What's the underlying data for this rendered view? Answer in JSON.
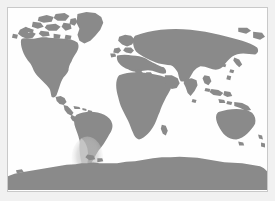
{
  "figure": {
    "type": "world-map",
    "projection": "equirectangular",
    "title": "",
    "caption": "",
    "width": 275,
    "height": 201
  },
  "colors": {
    "land": "#8a8a8a",
    "land_faded": "#c4c4c4",
    "ocean": "#fefefe",
    "frame_border": "#c9c9c9",
    "outer_margin": "#f1f1f1"
  },
  "map": {
    "frame": {
      "x": 7,
      "y": 7,
      "width": 261,
      "height": 185
    },
    "graticule": {
      "visible": false
    },
    "labels": [],
    "legend": {
      "visible": false
    },
    "scalebar": {
      "visible": false
    },
    "north_arrow": {
      "visible": false
    }
  },
  "regions": [
    {
      "name": "north-america",
      "label": "",
      "shade": "land"
    },
    {
      "name": "greenland",
      "label": "",
      "shade": "land"
    },
    {
      "name": "canadian-arctic-archipelago",
      "label": "",
      "shade": "land"
    },
    {
      "name": "alaska",
      "label": "",
      "shade": "land"
    },
    {
      "name": "central-america",
      "label": "",
      "shade": "land"
    },
    {
      "name": "caribbean-islands",
      "label": "",
      "shade": "land"
    },
    {
      "name": "south-america",
      "label": "",
      "shade": "land"
    },
    {
      "name": "southern-cone-highlight",
      "label": "",
      "shade": "land_faded"
    },
    {
      "name": "europe",
      "label": "",
      "shade": "land"
    },
    {
      "name": "british-isles",
      "label": "",
      "shade": "land"
    },
    {
      "name": "scandinavia",
      "label": "",
      "shade": "land"
    },
    {
      "name": "africa",
      "label": "",
      "shade": "land"
    },
    {
      "name": "madagascar",
      "label": "",
      "shade": "land"
    },
    {
      "name": "middle-east",
      "label": "",
      "shade": "land"
    },
    {
      "name": "asia",
      "label": "",
      "shade": "land"
    },
    {
      "name": "india",
      "label": "",
      "shade": "land"
    },
    {
      "name": "japan",
      "label": "",
      "shade": "land"
    },
    {
      "name": "southeast-asia-islands",
      "label": "",
      "shade": "land"
    },
    {
      "name": "new-guinea",
      "label": "",
      "shade": "land"
    },
    {
      "name": "australia",
      "label": "",
      "shade": "land"
    },
    {
      "name": "new-zealand",
      "label": "",
      "shade": "land"
    },
    {
      "name": "antarctica",
      "label": "",
      "shade": "land"
    }
  ]
}
